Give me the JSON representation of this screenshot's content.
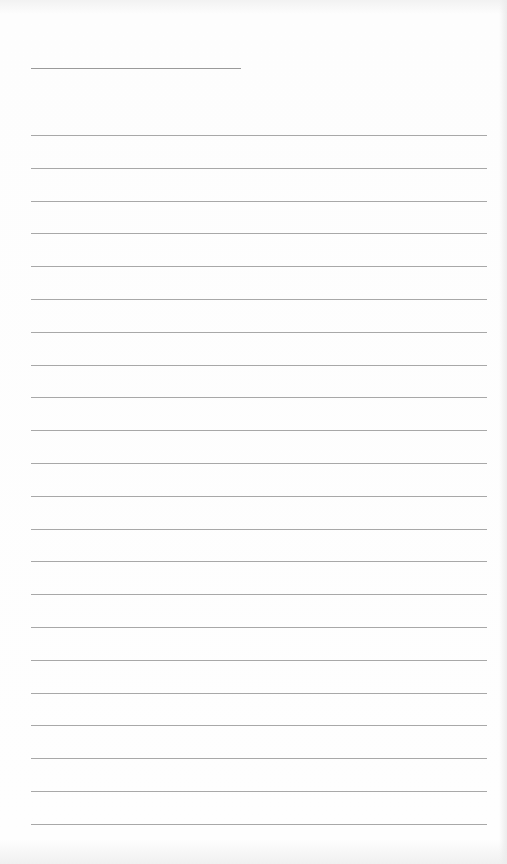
{
  "page": {
    "type": "lined-paper",
    "background": "#fdfdfd",
    "line_color": "#a8a8a8",
    "title_line": {
      "x": 31,
      "y": 68,
      "width": 210
    },
    "rules": {
      "x": 31,
      "width": 456,
      "first_y": 135,
      "spacing": 32.8,
      "count": 22
    }
  }
}
